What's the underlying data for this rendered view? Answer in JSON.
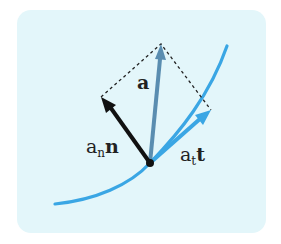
{
  "colors": {
    "panel_bg": "#e3f6fa",
    "curve": "#3aa6e4",
    "accel_vector": "#5a8db0",
    "normal_vector": "#111111",
    "tangent_vector": "#3aa6e4",
    "dashed": "#222222"
  },
  "labels": {
    "a": "a",
    "an_base": "a",
    "an_sub": "n",
    "an_vec": "n",
    "at_base": "a",
    "at_sub": "t",
    "at_vec": "t"
  },
  "geometry": {
    "origin": [
      150,
      163
    ],
    "a_tip": [
      161,
      44
    ],
    "n_tip": [
      101,
      97
    ],
    "t_tip": [
      211,
      110
    ]
  }
}
